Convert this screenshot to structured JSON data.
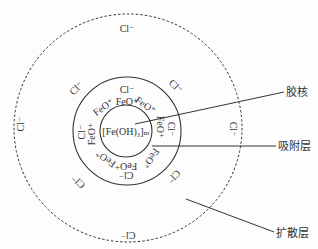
{
  "diagram": {
    "type": "colloid-micelle-structure",
    "colors": {
      "stroke": "#333333",
      "text": "#333333",
      "background": "#fdfdfd"
    },
    "core_formula": "[Fe(OH)₃]ₘ",
    "labels": {
      "core": "胶核",
      "adsorption_layer": "吸附层",
      "diffusion_layer": "扩散层"
    },
    "circles": [
      {
        "name": "core-circle",
        "cx": 126,
        "cy": 131,
        "r": 26,
        "style": "solid"
      },
      {
        "name": "adsorption-circle",
        "cx": 127,
        "cy": 131,
        "r": 54,
        "style": "solid"
      },
      {
        "name": "diffusion-circle",
        "cx": 128,
        "cy": 128,
        "r": 114,
        "style": "dashed"
      }
    ],
    "adsorbed_ions": [
      {
        "text": "FeO⁺",
        "x": 127,
        "y": 103,
        "rot": 0
      },
      {
        "text": "FeO⁺",
        "x": 145,
        "y": 106,
        "rot": 35
      },
      {
        "text": "FeO⁺",
        "x": 159,
        "y": 127,
        "rot": 90
      },
      {
        "text": "FeO⁺",
        "x": 150,
        "y": 158,
        "rot": 125
      },
      {
        "text": "FeO⁺",
        "x": 126,
        "y": 165,
        "rot": 180
      },
      {
        "text": "FeO⁺",
        "x": 106,
        "y": 158,
        "rot": 215
      },
      {
        "text": "FeO⁺",
        "x": 93,
        "y": 134,
        "rot": -90
      },
      {
        "text": "FeO⁺",
        "x": 104,
        "y": 108,
        "rot": -35
      }
    ],
    "inner_counter_ions": [
      {
        "text": "Cl⁻",
        "x": 127,
        "y": 91,
        "rot": 0
      },
      {
        "text": "Cl⁻",
        "x": 170,
        "y": 129,
        "rot": 90
      },
      {
        "text": "Cl⁻",
        "x": 126,
        "y": 174,
        "rot": 180
      },
      {
        "text": "Cl⁻",
        "x": 83,
        "y": 132,
        "rot": -90
      }
    ],
    "diffuse_counter_ions": [
      {
        "text": "Cl⁻",
        "x": 127,
        "y": 30,
        "rot": 0
      },
      {
        "text": "Cl⁻",
        "x": 77,
        "y": 89,
        "rot": -45
      },
      {
        "text": "Cl⁻",
        "x": 175,
        "y": 87,
        "rot": 45
      },
      {
        "text": "Cl⁻",
        "x": 22,
        "y": 124,
        "rot": -90
      },
      {
        "text": "Cl⁻",
        "x": 232,
        "y": 129,
        "rot": 90
      },
      {
        "text": "Cl⁻",
        "x": 79,
        "y": 181,
        "rot": -135
      },
      {
        "text": "Cl⁻",
        "x": 173,
        "y": 176,
        "rot": 135
      },
      {
        "text": "Cl⁻",
        "x": 128,
        "y": 234,
        "rot": 180
      }
    ],
    "leader_lines": [
      {
        "name": "core-leader",
        "x1": 135,
        "y1": 124,
        "x2": 284,
        "y2": 92
      },
      {
        "name": "adsorption-leader",
        "x1": 152,
        "y1": 146,
        "x2": 276,
        "y2": 146
      },
      {
        "name": "diffusion-leader",
        "x1": 186,
        "y1": 199,
        "x2": 274,
        "y2": 232
      }
    ]
  }
}
